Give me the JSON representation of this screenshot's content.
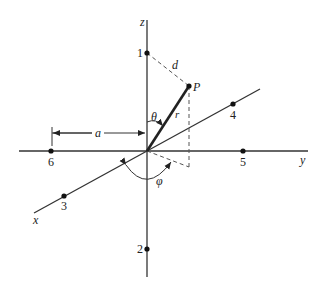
{
  "diagram": {
    "axes": {
      "x": {
        "label": "x"
      },
      "y": {
        "label": "y"
      },
      "z": {
        "label": "z"
      }
    },
    "points": [
      {
        "id": "1",
        "label": "1",
        "axis": "z+"
      },
      {
        "id": "2",
        "label": "2",
        "axis": "z-"
      },
      {
        "id": "3",
        "label": "3",
        "axis": "x+"
      },
      {
        "id": "4",
        "label": "4",
        "axis": "x-"
      },
      {
        "id": "5",
        "label": "5",
        "axis": "y+"
      },
      {
        "id": "6",
        "label": "6",
        "axis": "y-"
      }
    ],
    "point_P": {
      "label": "P"
    },
    "labels": {
      "r": "r",
      "theta": "θ",
      "phi": "φ",
      "d": "d",
      "a": "a"
    },
    "colors": {
      "ink": "#222222",
      "background": "#ffffff"
    }
  }
}
